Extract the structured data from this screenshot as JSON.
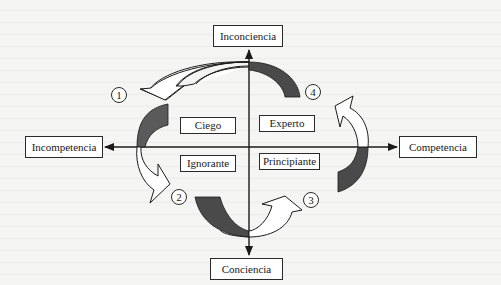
{
  "diagram": {
    "title": "",
    "axes": {
      "top": "Inconciencia",
      "bottom": "Conciencia",
      "left": "Incompetencia",
      "right": "Competencia"
    },
    "quadrants": {
      "top_left": "Ciego",
      "top_right": "Experto",
      "bottom_left": "Ignorante",
      "bottom_right": "Principiante"
    },
    "steps": [
      "1",
      "2",
      "3",
      "4"
    ],
    "colors": {
      "line": "#1a1a1a",
      "filled_arrow": "#555555",
      "box_fill": "#ffffff",
      "background": "#f5f5f3"
    }
  }
}
